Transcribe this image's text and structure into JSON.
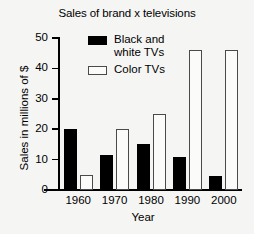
{
  "chart_data": {
    "type": "bar",
    "title": "Sales of brand x televisions",
    "xlabel": "Year",
    "ylabel": "Sales in millions of $",
    "categories": [
      "1960",
      "1970",
      "1980",
      "1990",
      "2000"
    ],
    "series": [
      {
        "name": "Black and\nwhite TVs",
        "values": [
          20,
          11.5,
          15,
          11,
          4.5
        ],
        "color": "#000000",
        "style": "filled"
      },
      {
        "name": "Color TVs",
        "values": [
          5,
          20,
          25,
          46,
          46
        ],
        "color": "#ffffff",
        "style": "outlined"
      }
    ],
    "ylim": [
      0,
      50
    ],
    "yticks": [
      0,
      10,
      20,
      30,
      40,
      50
    ],
    "ytick_labels": [
      "0",
      "10",
      "20",
      "30",
      "40",
      "50"
    ],
    "grid": false,
    "legend_position": "upper center"
  }
}
